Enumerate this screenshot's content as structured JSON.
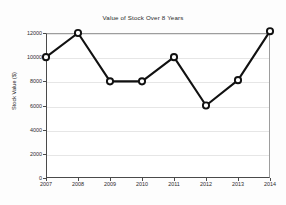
{
  "chart_data": {
    "type": "line",
    "title": "Value of Stock Over 8 Years",
    "xlabel": "",
    "ylabel": "Stock Value ($)",
    "categories": [
      "2007",
      "2008",
      "2009",
      "2010",
      "2011",
      "2012",
      "2013",
      "2014"
    ],
    "values": [
      10000,
      12000,
      8000,
      8000,
      10000,
      6000,
      8100,
      12150
    ],
    "series": [
      {
        "name": "Stock Value",
        "values": [
          10000,
          12000,
          8000,
          8000,
          10000,
          6000,
          8100,
          12150
        ]
      }
    ],
    "xlim": [
      2007,
      2014
    ],
    "ylim": [
      0,
      12600
    ],
    "yticks": [
      0,
      2000,
      4000,
      6000,
      8000,
      10000,
      12000
    ],
    "ytick_labels": [
      "0",
      "2000",
      "4000",
      "6000",
      "8000",
      "10000",
      "12000"
    ],
    "xticks": [
      2007,
      2008,
      2009,
      2010,
      2011,
      2012,
      2013,
      2014
    ],
    "xtick_labels": [
      "2007",
      "2008",
      "2009",
      "2010",
      "2011",
      "2012",
      "2013",
      "2014"
    ],
    "grid": true,
    "grid_axis": "y",
    "legend": false,
    "legend_position": "none",
    "marker": "circle-open",
    "line_color": "#111111",
    "marker_face_color": "#ffffff",
    "grid_color": "#e6e6e6",
    "axis_color": "#4a4a4a",
    "background_color": "#ffffff"
  }
}
